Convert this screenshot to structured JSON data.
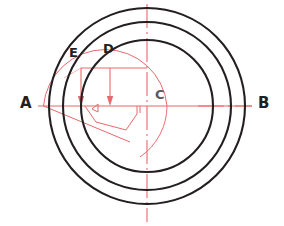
{
  "figure": {
    "background_color": "#ffffff",
    "width": 284,
    "height": 226,
    "black_ink_color": "#231f20",
    "red_ink_color": "#e8686c"
  },
  "labels": {
    "a": "A",
    "b": "B",
    "c": "C",
    "d": "D",
    "e": "E"
  },
  "geometry": {
    "center": {
      "x": 147,
      "y": 106,
      "label": "C"
    },
    "circles": [
      {
        "name": "inner-circle",
        "radius": 66,
        "color": "#231f20"
      },
      {
        "name": "middle-circle",
        "radius": 84,
        "color": "#231f20"
      },
      {
        "name": "outer-circle",
        "radius": 98,
        "color": "#231f20"
      }
    ],
    "axes": {
      "horizontal": {
        "from_label": "A",
        "to_label": "B",
        "y": 106,
        "x1": 38,
        "x2": 252
      },
      "vertical": {
        "x": 147,
        "y1": 4,
        "y2": 222,
        "style": "dash-dot"
      }
    },
    "construction": {
      "red_arc": {
        "cx": 105,
        "cy": 106,
        "radius": 62
      },
      "arrows": [
        {
          "name": "arrow-e",
          "x": 81,
          "y_top": 68,
          "y_tip": 104
        },
        {
          "name": "arrow-d",
          "x": 105,
          "y_top": 68,
          "y_tip": 104
        }
      ],
      "polygon_points": "85,106 96,122 126,130 137,114 137,106"
    }
  }
}
